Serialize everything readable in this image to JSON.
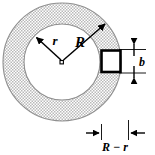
{
  "figure": {
    "type": "engineering-diagram",
    "labels": {
      "inner_radius": "r",
      "outer_radius": "R",
      "thickness": "b",
      "wall_thickness": "R − r"
    },
    "colors": {
      "stroke": "#000000",
      "hatch": "#8a8a8a",
      "fill_background": "#ffffff",
      "stipple_light": "#c8c8c8"
    },
    "geometry": {
      "center_x": 62,
      "center_y": 62,
      "outer_radius_px": 59,
      "inner_radius_px": 38,
      "square": {
        "x": 101,
        "y": 50,
        "width": 20,
        "height": 22,
        "stroke_width": 3
      },
      "b_dimension": {
        "x": 134,
        "top_y": 48,
        "bottom_y": 74
      },
      "rr_dimension": {
        "y": 133,
        "left_x": 101,
        "right_x": 129
      }
    }
  }
}
